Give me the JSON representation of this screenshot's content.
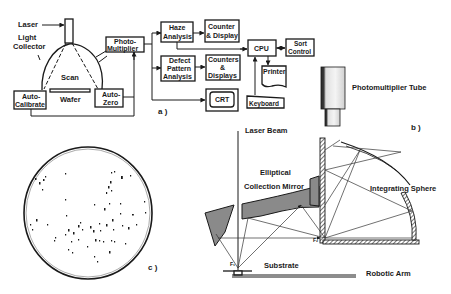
{
  "figure": {
    "panels": [
      {
        "id": "a",
        "label": "a )",
        "title": "Laser wafer scanning system block diagram",
        "components": {
          "laser": "Laser",
          "light_collector_line1": "Light",
          "light_collector_line2": "Collector",
          "scan": "Scan",
          "wafer": "Wafer",
          "auto_calibrate_line1": "Auto-",
          "auto_calibrate_line2": "Calibrate",
          "auto_zero_line1": "Auto-",
          "auto_zero_line2": "Zero",
          "photomultiplier_line1": "Photo-",
          "photomultiplier_line2": "Multiplier",
          "haze_line1": "Haze",
          "haze_line2": "Analysis",
          "counter_display_line1": "Counter",
          "counter_display_line2": "& Display",
          "defect_line1": "Defect",
          "defect_line2": "Pattern",
          "defect_line3": "Analysis",
          "counters_displays_line1": "Counters",
          "counters_displays_line2": "&",
          "counters_displays_line3": "Displays",
          "crt": "CRT",
          "cpu": "CPU",
          "sort_control_line1": "Sort",
          "sort_control_line2": "Control",
          "printer": "Printer",
          "keyboard": "Keyboard"
        }
      },
      {
        "id": "b",
        "label": "b )",
        "title": "Optical collection geometry",
        "components": {
          "photomultiplier_tube": "Photomultiplier Tube",
          "laser_beam": "Laser Beam",
          "elliptical": "Elliptical",
          "collection_mirror": "Collection Mirror",
          "integrating_sphere": "Integrating Sphere",
          "focus1": "F₁",
          "focus2": "F₂",
          "substrate": "Substrate",
          "robotic_arm": "Robotic Arm"
        }
      },
      {
        "id": "c",
        "label": "c )",
        "title": "Wafer defect map"
      }
    ],
    "colors": {
      "ink": "#1a1a1a",
      "mirror_fill": "#8a8a8a",
      "background": "#ffffff"
    }
  }
}
